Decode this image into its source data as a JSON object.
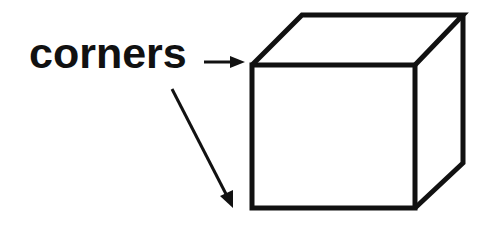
{
  "diagram": {
    "label": "corners",
    "shape": "cube",
    "stroke_color": "#111111",
    "background": "#ffffff",
    "arrows": [
      {
        "name": "horizontal-arrow",
        "target": "front-top-left-corner"
      },
      {
        "name": "diagonal-arrow",
        "target": "front-bottom-left-corner"
      }
    ]
  }
}
